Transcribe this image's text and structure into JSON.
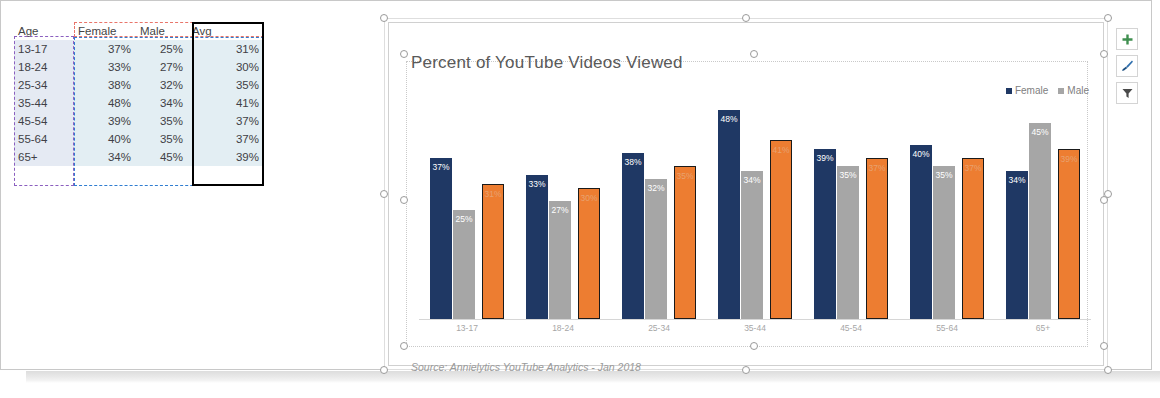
{
  "table": {
    "headers": [
      "Age",
      "Female",
      "Male",
      "Avg"
    ],
    "rows": [
      {
        "age": "13-17",
        "female": "37%",
        "male": "25%",
        "avg": "31%"
      },
      {
        "age": "18-24",
        "female": "33%",
        "male": "27%",
        "avg": "30%"
      },
      {
        "age": "25-34",
        "female": "38%",
        "male": "32%",
        "avg": "35%"
      },
      {
        "age": "35-44",
        "female": "48%",
        "male": "34%",
        "avg": "41%"
      },
      {
        "age": "45-54",
        "female": "39%",
        "male": "35%",
        "avg": "37%"
      },
      {
        "age": "55-64",
        "female": "40%",
        "male": "35%",
        "avg": "37%"
      },
      {
        "age": "65+",
        "female": "34%",
        "male": "45%",
        "avg": "39%"
      }
    ]
  },
  "chart": {
    "title": "Percent of YouTube Videos Viewed",
    "source": "Source: Annielytics YouTube Analytics - Jan 2018",
    "legend": [
      {
        "label": "Female",
        "color": "#1F3864"
      },
      {
        "label": "Male",
        "color": "#A6A6A6"
      }
    ],
    "buttons": [
      {
        "name": "chart-elements-button",
        "icon": "plus-icon",
        "color": "#3f8f4f"
      },
      {
        "name": "chart-styles-button",
        "icon": "brush-icon",
        "color": "#2f6fae"
      },
      {
        "name": "chart-filters-button",
        "icon": "funnel-icon",
        "color": "#555555"
      }
    ]
  },
  "chart_data": {
    "type": "bar",
    "title": "Percent of YouTube Videos Viewed",
    "xlabel": "",
    "ylabel": "",
    "ylim": [
      0,
      50
    ],
    "grid": false,
    "legend_position": "top-right",
    "annotation": "Source: Annielytics YouTube Analytics - Jan 2018",
    "categories": [
      "13-17",
      "18-24",
      "25-34",
      "35-44",
      "45-54",
      "55-64",
      "65+"
    ],
    "series": [
      {
        "name": "Female",
        "color": "#1F3864",
        "values": [
          37,
          33,
          38,
          48,
          39,
          40,
          34
        ],
        "labels": [
          "37%",
          "33%",
          "38%",
          "48%",
          "39%",
          "40%",
          "34%"
        ]
      },
      {
        "name": "Male",
        "color": "#A6A6A6",
        "values": [
          25,
          27,
          32,
          34,
          35,
          35,
          45
        ],
        "labels": [
          "25%",
          "27%",
          "32%",
          "34%",
          "35%",
          "35%",
          "45%"
        ]
      },
      {
        "name": "Avg",
        "color": "#ED7D31",
        "values": [
          31,
          30,
          35,
          41,
          37,
          37,
          39
        ],
        "labels": [
          "31%",
          "30%",
          "35%",
          "41%",
          "37%",
          "37%",
          "39%"
        ]
      }
    ]
  }
}
